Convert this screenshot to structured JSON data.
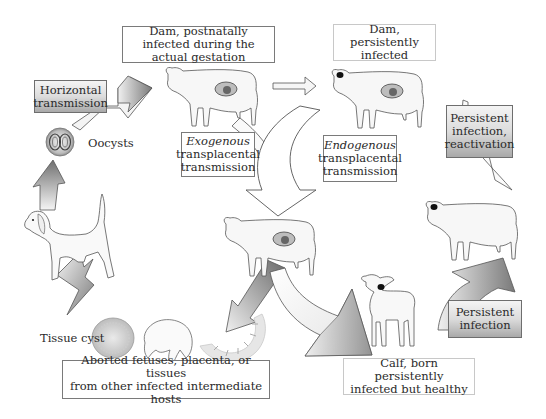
{
  "diagram": {
    "type": "life-cycle diagram",
    "boxes": {
      "dam_postnatal": {
        "line1": "Dam, postnatally",
        "line2": "infected during the actual gestation"
      },
      "dam_persistent": {
        "line1": "Dam, persistently",
        "line2": "infected"
      },
      "horizontal": {
        "line1": "Horizontal",
        "line2": "transmission"
      },
      "exogenous": {
        "line1": "Exogenous",
        "line2": "transplacental",
        "line3": "transmission"
      },
      "endogenous": {
        "line1": "Endogenous",
        "line2": "transplacental",
        "line3": "transmission"
      },
      "reactivation": {
        "line1": "Persistent",
        "line2": "infection,",
        "line3": "reactivation"
      },
      "persistent_infection": {
        "line1": "Persistent",
        "line2": "infection"
      },
      "aborted": {
        "line1": "Aborted fetuses, placenta, or tissues",
        "line2": "from other infected intermediate hosts"
      },
      "calf": {
        "line1": "Calf, born persistently",
        "line2": "infected but healthy"
      }
    },
    "labels": {
      "oocysts": "Oocysts",
      "tissue_cyst": "Tissue cyst"
    },
    "nodes": [
      "dog",
      "oocysts",
      "dam-postnatal-cow",
      "dam-persistent-cow",
      "pregnant-cow-center",
      "calf",
      "adult-cow-right",
      "tissue-cyst",
      "aborted-fetus",
      "placenta"
    ],
    "colors": {
      "arrow_dark": "#7d7d7d",
      "arrow_light": "#f2f2f2",
      "outline": "#555555",
      "box_border": "#7a7a7a"
    }
  }
}
